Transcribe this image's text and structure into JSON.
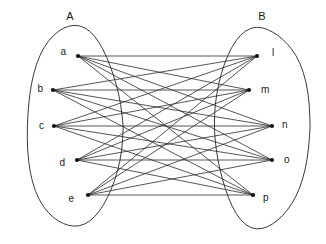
{
  "figure": {
    "title": "",
    "type": "bipartite-graph",
    "background_color": "#ffffff",
    "line_color": "#2b2b2b",
    "label_color": "#1a1a1a"
  },
  "sets": {
    "left": {
      "name": "A",
      "label_x": 70,
      "label_y": 20,
      "hull": {
        "cx": 74,
        "cy": 127,
        "rx": 48,
        "ry": 101
      }
    },
    "right": {
      "name": "B",
      "label_x": 262,
      "label_y": 20,
      "hull": {
        "cx": 262,
        "cy": 127,
        "rx": 48,
        "ry": 101
      }
    }
  },
  "nodes": {
    "left": [
      {
        "id": "a",
        "label": "a",
        "x": 78,
        "y": 56,
        "label_x": 66,
        "label_y": 55
      },
      {
        "id": "b",
        "label": "b",
        "x": 53,
        "y": 90,
        "label_x": 43,
        "label_y": 92
      },
      {
        "id": "c",
        "label": "c",
        "x": 54,
        "y": 126,
        "label_x": 44,
        "label_y": 129
      },
      {
        "id": "d",
        "label": "d",
        "x": 77,
        "y": 160,
        "label_x": 65,
        "label_y": 166
      },
      {
        "id": "e",
        "label": "e",
        "x": 88,
        "y": 195,
        "label_x": 74,
        "label_y": 202
      }
    ],
    "right": [
      {
        "id": "l",
        "label": "l",
        "x": 257,
        "y": 56,
        "label_x": 272,
        "label_y": 56
      },
      {
        "id": "m",
        "label": "m",
        "x": 249,
        "y": 90,
        "label_x": 261,
        "label_y": 93
      },
      {
        "id": "n",
        "label": "n",
        "x": 272,
        "y": 126,
        "label_x": 282,
        "label_y": 128
      },
      {
        "id": "o",
        "label": "o",
        "x": 272,
        "y": 160,
        "label_x": 284,
        "label_y": 163
      },
      {
        "id": "p",
        "label": "p",
        "x": 253,
        "y": 195,
        "label_x": 263,
        "label_y": 201
      }
    ]
  },
  "chart_data": {
    "type": "graph",
    "graph_kind": "complete-bipartite",
    "notation": "K5,5",
    "left_partition": [
      "a",
      "b",
      "c",
      "d",
      "e"
    ],
    "right_partition": [
      "l",
      "m",
      "n",
      "o",
      "p"
    ],
    "left_partition_label": "A",
    "right_partition_label": "B",
    "edge_count": 25,
    "edges": [
      [
        "a",
        "l"
      ],
      [
        "a",
        "m"
      ],
      [
        "a",
        "n"
      ],
      [
        "a",
        "o"
      ],
      [
        "a",
        "p"
      ],
      [
        "b",
        "l"
      ],
      [
        "b",
        "m"
      ],
      [
        "b",
        "n"
      ],
      [
        "b",
        "o"
      ],
      [
        "b",
        "p"
      ],
      [
        "c",
        "l"
      ],
      [
        "c",
        "m"
      ],
      [
        "c",
        "n"
      ],
      [
        "c",
        "o"
      ],
      [
        "c",
        "p"
      ],
      [
        "d",
        "l"
      ],
      [
        "d",
        "m"
      ],
      [
        "d",
        "n"
      ],
      [
        "d",
        "o"
      ],
      [
        "d",
        "p"
      ],
      [
        "e",
        "l"
      ],
      [
        "e",
        "m"
      ],
      [
        "e",
        "n"
      ],
      [
        "e",
        "o"
      ],
      [
        "e",
        "p"
      ]
    ]
  }
}
